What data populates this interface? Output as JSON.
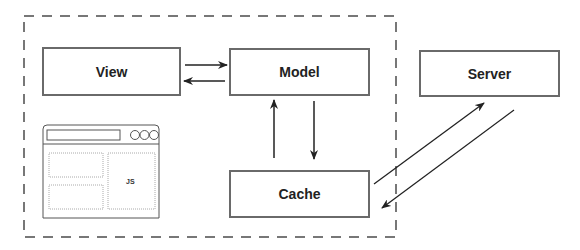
{
  "diagram": {
    "boundary": "client",
    "nodes": [
      {
        "id": "view",
        "label": "View"
      },
      {
        "id": "model",
        "label": "Model"
      },
      {
        "id": "cache",
        "label": "Cache"
      },
      {
        "id": "server",
        "label": "Server"
      }
    ],
    "edges": [
      {
        "from": "view",
        "to": "model"
      },
      {
        "from": "model",
        "to": "view"
      },
      {
        "from": "cache",
        "to": "model"
      },
      {
        "from": "model",
        "to": "cache"
      },
      {
        "from": "cache",
        "to": "server"
      },
      {
        "from": "server",
        "to": "cache"
      }
    ],
    "browser_illustration": {
      "panel_label": "JS"
    }
  },
  "colors": {
    "stroke": "#6a6a6a",
    "arrow": "#222222",
    "dashed_border": "#777777"
  }
}
